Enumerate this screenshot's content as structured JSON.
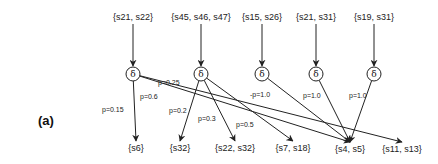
{
  "panel_label": "(a)",
  "top_states": [
    {
      "id": "t1",
      "label": "{s21, s22}",
      "x": 133,
      "y": 20
    },
    {
      "id": "t2",
      "label": "{s45, s46, s47}",
      "x": 201,
      "y": 20
    },
    {
      "id": "t3",
      "label": "{s15, s26}",
      "x": 262,
      "y": 20
    },
    {
      "id": "t4",
      "label": "{s21, s31}",
      "x": 316,
      "y": 20
    },
    {
      "id": "t5",
      "label": "{s19, s31}",
      "x": 374,
      "y": 20
    }
  ],
  "delta_nodes": [
    {
      "id": "d1",
      "label": "δ",
      "x": 133,
      "y": 74
    },
    {
      "id": "d2",
      "label": "δ",
      "x": 201,
      "y": 74
    },
    {
      "id": "d3",
      "label": "δ",
      "x": 262,
      "y": 74
    },
    {
      "id": "d4",
      "label": "δ",
      "x": 316,
      "y": 74
    },
    {
      "id": "d5",
      "label": "δ",
      "x": 374,
      "y": 74
    }
  ],
  "bottom_states": [
    {
      "id": "b1",
      "label": "{s6}",
      "x": 136,
      "y": 151
    },
    {
      "id": "b2",
      "label": "{s32}",
      "x": 180,
      "y": 151
    },
    {
      "id": "b3",
      "label": "{s22, s32}",
      "x": 235,
      "y": 151
    },
    {
      "id": "b4",
      "label": "{s7, s18}",
      "x": 293,
      "y": 151
    },
    {
      "id": "b5",
      "label": "{s4, s5}",
      "x": 350,
      "y": 152
    },
    {
      "id": "b6",
      "label": "{s11, s13}",
      "x": 402,
      "y": 152
    }
  ],
  "edges": [
    {
      "from": "d1",
      "to": "b1",
      "prob": "p=0.15",
      "lx": 102,
      "ly": 112
    },
    {
      "from": "d1",
      "to": "b5",
      "prob": "p=0.6",
      "lx": 140,
      "ly": 99
    },
    {
      "from": "d1",
      "to": "b6",
      "prob": "p=0.25",
      "lx": 158,
      "ly": 85
    },
    {
      "from": "d2",
      "to": "b2",
      "prob": "p=0.2",
      "lx": 169,
      "ly": 113
    },
    {
      "from": "d2",
      "to": "b3",
      "prob": "p=0.3",
      "lx": 198,
      "ly": 121
    },
    {
      "from": "d2",
      "to": "b4",
      "prob": "p=0.5",
      "lx": 236,
      "ly": 127
    },
    {
      "from": "d3",
      "to": "b5",
      "prob": "-p=1.0",
      "lx": 250,
      "ly": 97
    },
    {
      "from": "d4",
      "to": "b5",
      "prob": "p=1.0",
      "lx": 303,
      "ly": 98
    },
    {
      "from": "d5",
      "to": "b5",
      "prob": "p=1.0",
      "lx": 349,
      "ly": 98
    }
  ],
  "colors": {
    "stroke": "#222222",
    "background": "#ffffff"
  }
}
